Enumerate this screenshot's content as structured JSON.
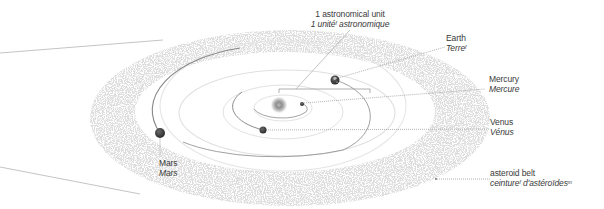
{
  "diagram": {
    "type": "solar-system-inner-planets",
    "colors": {
      "orbit_dark": "#8a8a8a",
      "orbit_light": "#dedede",
      "planet": "#3b3b3b",
      "sun_core": "#8f8f8f",
      "leader_line": "#9a9a9a",
      "asteroid_dots": "#c8c8c8",
      "label_text": "#3a3a3a"
    },
    "labels": {
      "au": {
        "en": "1 astronomical unit",
        "fr_main": "1 unité",
        "fr_gender": "f",
        "fr_tail": " astronomique"
      },
      "earth": {
        "en": "Earth",
        "fr_main": "Terre",
        "fr_gender": "f"
      },
      "mercury": {
        "en": "Mercury",
        "fr_main": "Mercure",
        "fr_gender": ""
      },
      "venus": {
        "en": "Venus",
        "fr_main": "Vénus",
        "fr_gender": ""
      },
      "mars": {
        "en": "Mars",
        "fr_main": "Mars",
        "fr_gender": ""
      },
      "asteroid_belt": {
        "en": "asteroid belt",
        "fr_main": "ceinture",
        "fr_gender": "f",
        "fr_tail": " d'astéroïdes",
        "fr_gender2": "m"
      }
    },
    "bodies": [
      {
        "name": "Sun",
        "x": 279,
        "y": 105,
        "r": 8
      },
      {
        "name": "Mercury",
        "x": 302,
        "y": 104,
        "r": 2
      },
      {
        "name": "Venus",
        "x": 263,
        "y": 130,
        "r": 3.5
      },
      {
        "name": "Earth",
        "x": 335,
        "y": 80,
        "r": 4.5
      },
      {
        "name": "Mars",
        "x": 160,
        "y": 133,
        "r": 5
      }
    ]
  }
}
